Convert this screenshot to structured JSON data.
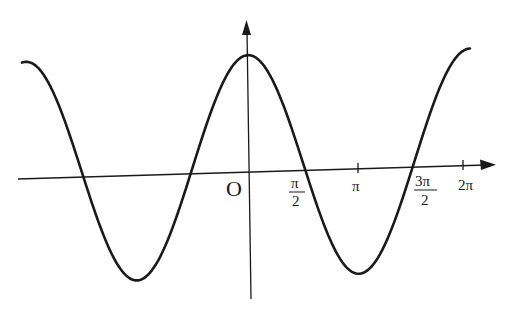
{
  "figure": {
    "function": "y = cos(2x)",
    "colors": {
      "curve": "#1a1a1a",
      "axes": "#1a1a1a",
      "background": "#ffffff"
    }
  },
  "axes": {
    "origin_label": "O",
    "x_ticks": [
      {
        "label_num": "π",
        "label_den": "2",
        "value": "π/2"
      },
      {
        "label": "π",
        "value": "π"
      },
      {
        "label_num": "3π",
        "label_den": "2",
        "value": "3π/2"
      },
      {
        "label": "2π",
        "value": "2π"
      }
    ]
  },
  "chart_data": {
    "type": "line",
    "title": "",
    "xlabel": "",
    "ylabel": "",
    "function": "y = cos(2x)",
    "x_ticks": [
      "π/2",
      "π",
      "3π/2",
      "2π"
    ],
    "origin": "O",
    "key_points": [
      {
        "x": "-π",
        "y": 1,
        "note": "left edge (local max)"
      },
      {
        "x": "-3π/4",
        "y": 0
      },
      {
        "x": "-π/2",
        "y": -1,
        "note": "minimum"
      },
      {
        "x": "-π/4",
        "y": 0
      },
      {
        "x": "0",
        "y": 1,
        "note": "maximum on y-axis"
      },
      {
        "x": "π/4",
        "y": 0
      },
      {
        "x": "π/2",
        "y": -1,
        "note": "minimum"
      },
      {
        "x": "3π/4",
        "y": 0
      },
      {
        "x": "π",
        "y": 1,
        "note": "right edge (local max)"
      }
    ],
    "grid": false,
    "legend": null
  }
}
